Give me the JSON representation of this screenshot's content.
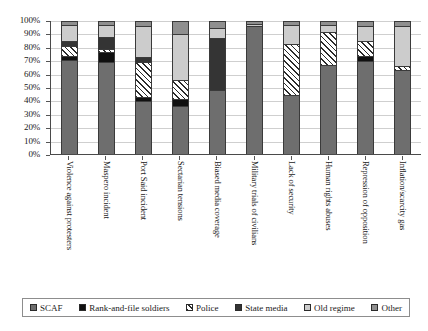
{
  "chart_data": {
    "type": "bar",
    "subtype": "stacked-bar-100-percent",
    "title": "",
    "xlabel": "",
    "ylabel": "",
    "ylim": [
      0,
      100
    ],
    "yticks": [
      "0%",
      "10%",
      "20%",
      "30%",
      "40%",
      "50%",
      "60%",
      "70%",
      "80%",
      "90%",
      "100%"
    ],
    "grid": true,
    "legend_position": "bottom",
    "categories": [
      "Violence against protesters",
      "Maspero incident",
      "Port Said incident",
      "Sectarian tensions",
      "Biased media coverage",
      "Military trials of civilians",
      "Lack of security",
      "Human rights abuses",
      "Repression of opposition",
      "Inflation/scarcity gas"
    ],
    "series": [
      {
        "name": "SCAF",
        "color": "#6e6e6e",
        "pattern": "solid",
        "values": [
          71,
          69,
          40,
          36,
          48,
          96,
          44,
          67,
          70,
          63
        ]
      },
      {
        "name": "Rank-and-file soldiers",
        "color": "#101010",
        "pattern": "solid",
        "values": [
          3,
          8,
          3,
          5,
          0,
          0,
          0,
          0,
          4,
          0
        ]
      },
      {
        "name": "Police",
        "color": "#ffffff",
        "pattern": "diagonal-hatch",
        "values": [
          7,
          2,
          26,
          15,
          0,
          0,
          39,
          25,
          11,
          3
        ]
      },
      {
        "name": "State media",
        "color": "#343434",
        "pattern": "solid",
        "values": [
          4,
          9,
          4,
          0,
          39,
          0,
          0,
          0,
          0,
          0
        ]
      },
      {
        "name": "Old regime",
        "color": "#cccccc",
        "pattern": "solid",
        "values": [
          12,
          9,
          23,
          34,
          8,
          2,
          14,
          5,
          11,
          30
        ]
      },
      {
        "name": "Other",
        "color": "#8f8f8f",
        "pattern": "solid",
        "values": [
          3,
          3,
          4,
          10,
          5,
          2,
          3,
          3,
          4,
          4
        ]
      }
    ]
  },
  "legend": {
    "items": [
      {
        "label": "SCAF"
      },
      {
        "label": "Rank-and-file soldiers"
      },
      {
        "label": "Police"
      },
      {
        "label": "State media"
      },
      {
        "label": "Old regime"
      },
      {
        "label": "Other"
      }
    ]
  }
}
